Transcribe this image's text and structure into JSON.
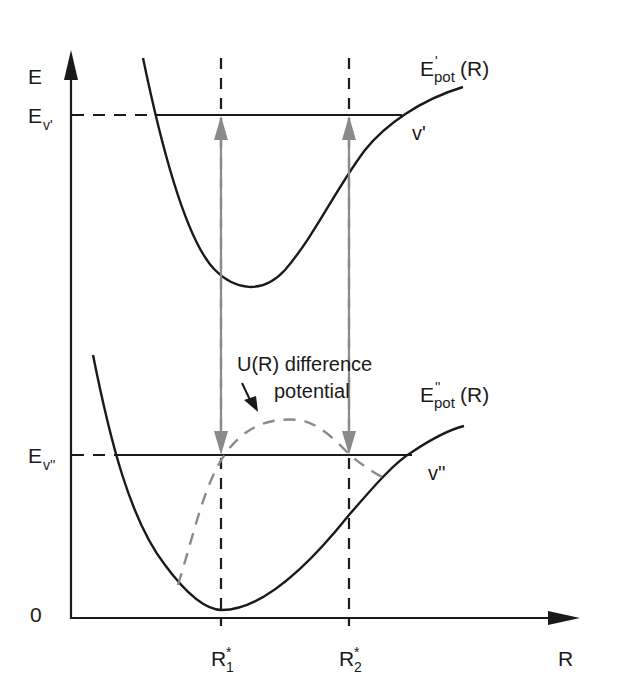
{
  "diagram": {
    "type": "potential-energy-curves",
    "axes": {
      "y_label": "E",
      "x_label": "R",
      "origin_label": "0"
    },
    "levels": {
      "upper": {
        "axis_label_main": "E",
        "axis_label_sub": "v'",
        "level_label": "v'"
      },
      "lower": {
        "axis_label_main": "E",
        "axis_label_sub": "v''",
        "level_label": "v''"
      }
    },
    "curves": {
      "upper": {
        "main": "E",
        "sup": "'",
        "sub": "pot",
        "suffix": "(R)"
      },
      "lower": {
        "main": "E",
        "sup": "''",
        "sub": "pot",
        "suffix": "(R)"
      },
      "difference": {
        "line1": "U(R) difference",
        "line2": "potential"
      }
    },
    "x_markers": [
      {
        "main": "R",
        "sub": "1",
        "sup": "*"
      },
      {
        "main": "R",
        "sub": "2",
        "sup": "*"
      }
    ],
    "colors": {
      "line": "#1a1a1a",
      "arrow": "#8a8a8a",
      "dashed_difference": "#8a8a8a"
    }
  }
}
